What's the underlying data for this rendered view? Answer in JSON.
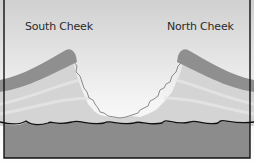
{
  "diagram": {
    "labels": {
      "south": "South Cheek",
      "north": "North Cheek"
    },
    "colors": {
      "sky_top": "#d2d2d2",
      "sky_bottom": "#ffffff",
      "cheek_band": "#8f8f8f",
      "strata": "#cfcfcf",
      "base_rock": "#8c8c8c",
      "outline": "#111111"
    }
  }
}
